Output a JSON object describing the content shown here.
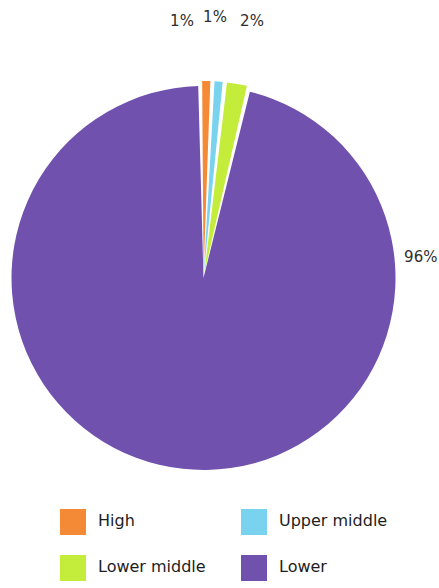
{
  "chart_data": {
    "type": "pie",
    "title": "",
    "subtitle": "",
    "xlabel": "",
    "ylabel": "",
    "legend_position": "bottom",
    "grid": false,
    "categories": [
      "High",
      "Upper middle",
      "Lower middle",
      "Lower"
    ],
    "values": [
      1,
      1,
      2,
      96
    ],
    "value_labels": [
      "1%",
      "1%",
      "2%",
      "96%"
    ],
    "colors": [
      "#F58A36",
      "#79D3EF",
      "#C3EC3B",
      "#7052AE"
    ],
    "slices": [
      {
        "label": "High",
        "value": 1,
        "value_label": "1%",
        "color": "#F58A36"
      },
      {
        "label": "Upper middle",
        "value": 1,
        "value_label": "1%",
        "color": "#79D3EF"
      },
      {
        "label": "Lower middle",
        "value": 2,
        "value_label": "2%",
        "color": "#C3EC3B"
      },
      {
        "label": "Lower",
        "value": 96,
        "value_label": "96%",
        "color": "#7052AE"
      }
    ]
  },
  "labels": {
    "high_pct": "1%",
    "upper_middle_pct": "1%",
    "lower_middle_pct": "2%",
    "lower_pct": "96%"
  },
  "legend": {
    "items": [
      {
        "label": "High",
        "color": "#F58A36"
      },
      {
        "label": "Upper middle",
        "color": "#79D3EF"
      },
      {
        "label": "Lower middle",
        "color": "#C3EC3B"
      },
      {
        "label": "Lower",
        "color": "#7052AE"
      }
    ]
  },
  "colors": {
    "background": "#FFFFFF",
    "text": "#1D1D1D",
    "high": "#F58A36",
    "upper_middle": "#79D3EF",
    "lower_middle": "#C3EC3B",
    "lower": "#7052AE"
  }
}
